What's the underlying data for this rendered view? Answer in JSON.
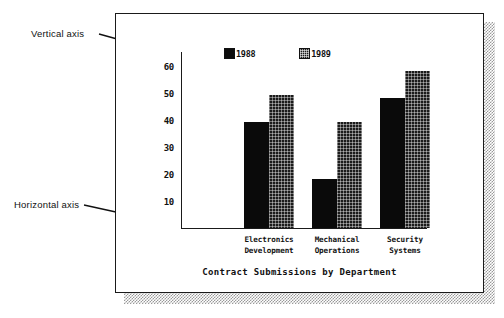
{
  "annotations": [
    {
      "name": "vertical-axis",
      "label": "Vertical axis"
    },
    {
      "name": "horizontal-axis",
      "label": "Horizontal axis"
    }
  ],
  "colors": {
    "series_1988": "#0a0a0a",
    "series_1989": "#1b1b1b",
    "axis": "#1a1a1a",
    "frame": "#1a1a1a",
    "shadow": "#9a9a9a",
    "background": "#ffffff",
    "text": "#111111"
  },
  "legend": [
    {
      "label": "1988",
      "swatch": "solid-black-square-icon"
    },
    {
      "label": "1989",
      "swatch": "hatched-dark-square-icon"
    }
  ],
  "chart_data": {
    "type": "bar",
    "title": "Contract Submissions by Department",
    "xlabel": "",
    "ylabel": "",
    "ylim": [
      0,
      65
    ],
    "yticks": [
      10,
      20,
      30,
      40,
      50,
      60
    ],
    "grid": false,
    "legend_position": "top-center",
    "categories": [
      "Electronics\nDevelopment",
      "Mechanical\nOperations",
      "Security\nSystems"
    ],
    "series": [
      {
        "name": "1988",
        "values": [
          39,
          18,
          48
        ]
      },
      {
        "name": "1989",
        "values": [
          49,
          39,
          58
        ]
      }
    ]
  }
}
